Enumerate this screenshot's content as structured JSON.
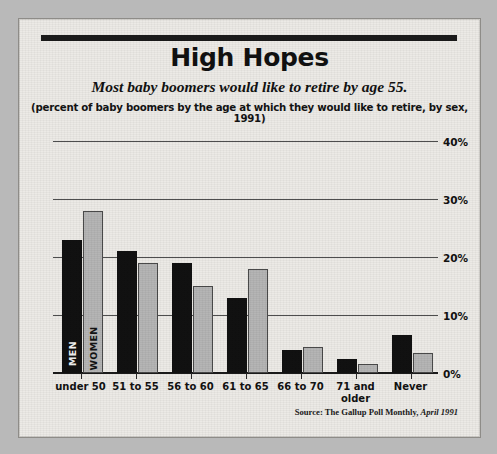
{
  "figure": {
    "title": "High Hopes",
    "subtitle": "Most baby boomers would like to retire by age 55.",
    "subsubtitle": "(percent of baby boomers by the age at which they would like to retire, by sex, 1991)",
    "source_prefix": "Source: The Gallup Poll Monthly,",
    "source_italic": "April 1991"
  },
  "legend": {
    "men": "MEN",
    "women": "WOMEN"
  },
  "chart_data": {
    "type": "bar",
    "title": "High Hopes",
    "subtitle": "Most baby boomers would like to retire by age 55.",
    "caption": "(percent of baby boomers by the age at which they would like to retire, by sex, 1991)",
    "xlabel": "",
    "ylabel": "",
    "ylim": [
      0,
      40
    ],
    "yticks": [
      0,
      10,
      20,
      30,
      40
    ],
    "ytick_labels": [
      "0%",
      "10%",
      "20%",
      "30%",
      "40%"
    ],
    "grid": true,
    "legend_position": "inside-first-bars",
    "categories": [
      "under 50",
      "51 to 55",
      "56 to 60",
      "61 to 65",
      "66 to 70",
      "71 and older",
      "Never"
    ],
    "series": [
      {
        "name": "MEN",
        "color": "#111111",
        "values": [
          23,
          21,
          19,
          13,
          4,
          2.5,
          6.5
        ]
      },
      {
        "name": "WOMEN",
        "color": "#b5b5b5",
        "values": [
          28,
          19,
          15,
          18,
          4.5,
          1.5,
          3.5
        ]
      }
    ],
    "source": "Source: The Gallup Poll Monthly, April 1991"
  }
}
